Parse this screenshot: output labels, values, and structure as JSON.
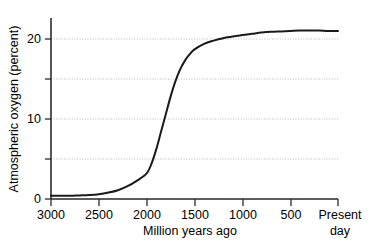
{
  "chart_data": {
    "type": "line",
    "title": "",
    "xlabel": "Million years ago",
    "ylabel": "Atmospheric oxygen (percent)",
    "x_reversed": true,
    "xlim": [
      3000,
      0
    ],
    "ylim": [
      0,
      23.5
    ],
    "grid": true,
    "grid_axis": "y",
    "grid_style": "dotted",
    "legend": "none",
    "x_ticks": [
      3000,
      2500,
      2000,
      1500,
      1000,
      500,
      0
    ],
    "x_tick_labels": [
      "3000",
      "2500",
      "2000",
      "1500",
      "1000",
      "500",
      "Present"
    ],
    "x_tick_label_extra": "day",
    "y_ticks": [
      0,
      5,
      10,
      15,
      20
    ],
    "y_tick_labels": [
      "0",
      "",
      "10",
      "",
      "20"
    ],
    "series": [
      {
        "name": "Atmospheric oxygen",
        "color": "#1a1a1a",
        "line_width": 2.0,
        "x": [
          3000,
          2900,
          2800,
          2700,
          2600,
          2500,
          2400,
          2300,
          2200,
          2100,
          2000,
          1950,
          1900,
          1850,
          1800,
          1750,
          1700,
          1650,
          1600,
          1550,
          1500,
          1400,
          1300,
          1200,
          1100,
          1000,
          900,
          800,
          700,
          600,
          500,
          400,
          300,
          200,
          100,
          0
        ],
        "y": [
          0.4,
          0.4,
          0.4,
          0.45,
          0.5,
          0.6,
          0.8,
          1.1,
          1.6,
          2.3,
          3.2,
          4.4,
          6.2,
          8.4,
          10.6,
          12.8,
          14.7,
          16.2,
          17.3,
          18.1,
          18.7,
          19.4,
          19.8,
          20.1,
          20.3,
          20.5,
          20.65,
          20.8,
          20.9,
          20.95,
          21.0,
          21.05,
          21.05,
          21.05,
          21.0,
          21.0
        ]
      }
    ]
  },
  "axis": {
    "x_label": "Million years ago",
    "x_label_line2": "",
    "y_label": "Atmospheric oxygen (percent)",
    "present_label_line1": "Present",
    "present_label_line2": "day"
  },
  "colors": {
    "curve": "#1a1a1a",
    "axis": "#2b2b2b",
    "grid": "#b8b8b8",
    "background": "#ffffff",
    "text": "#000000"
  }
}
